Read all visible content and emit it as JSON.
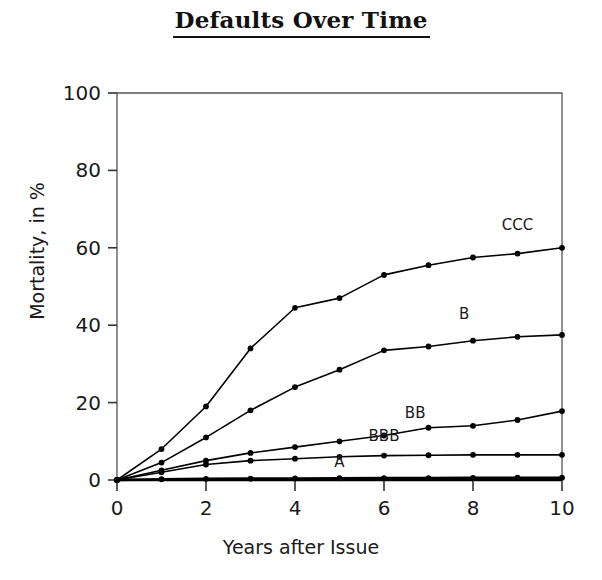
{
  "chart": {
    "title": "Defaults Over Time",
    "xlabel": "Years after Issue",
    "ylabel": "Mortality, in %"
  },
  "chart_data": {
    "type": "line",
    "title": "Defaults Over Time",
    "xlabel": "Years after Issue",
    "ylabel": "Mortality, in %",
    "xlim": [
      0,
      10
    ],
    "ylim": [
      0,
      100
    ],
    "xticks": [
      0,
      2,
      4,
      6,
      8,
      10
    ],
    "yticks": [
      0,
      20,
      40,
      60,
      80,
      100
    ],
    "grid": false,
    "legend": "inline-end-labels",
    "markers": "filled-circle",
    "line_color": "#000000",
    "x": [
      0,
      1,
      2,
      3,
      4,
      5,
      6,
      7,
      8,
      9,
      10
    ],
    "series": [
      {
        "name": "CCC",
        "label": "CCC",
        "values": [
          0,
          8,
          19,
          34,
          44.5,
          47,
          53,
          55.5,
          57.5,
          58.5,
          60
        ],
        "label_x": 9.0,
        "label_y": 64.5
      },
      {
        "name": "B",
        "label": "B",
        "values": [
          0,
          4.5,
          11,
          18,
          24,
          28.5,
          33.5,
          34.5,
          36,
          37,
          37.5
        ],
        "label_x": 7.8,
        "label_y": 41.5
      },
      {
        "name": "BB",
        "label": "BB",
        "values": [
          0,
          2.5,
          5,
          7,
          8.5,
          10,
          11.5,
          13.5,
          14,
          15.5,
          17.8
        ],
        "label_x": 6.7,
        "label_y": 16.0
      },
      {
        "name": "BBB",
        "label": "BBB",
        "values": [
          0,
          2,
          4,
          5,
          5.5,
          6,
          6.3,
          6.4,
          6.5,
          6.5,
          6.5
        ],
        "label_x": 6.0,
        "label_y": 10.2
      },
      {
        "name": "A",
        "label": "A",
        "values": [
          0,
          0.2,
          0.3,
          0.35,
          0.4,
          0.45,
          0.5,
          0.5,
          0.55,
          0.6,
          0.6
        ],
        "label_x": 5.0,
        "label_y": 3.4
      }
    ]
  }
}
